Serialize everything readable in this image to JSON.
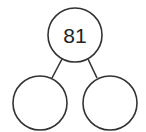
{
  "diagram": {
    "type": "number-bond",
    "whole": {
      "value": "81",
      "cx": 75,
      "cy": 35,
      "r": 27
    },
    "parts": [
      {
        "value": "",
        "cx": 40,
        "cy": 103,
        "r": 27
      },
      {
        "value": "",
        "cx": 110,
        "cy": 103,
        "r": 27
      }
    ],
    "connectors": [
      {
        "x1": 62,
        "y1": 59,
        "x2": 52,
        "y2": 78
      },
      {
        "x1": 88,
        "y1": 59,
        "x2": 97,
        "y2": 78
      }
    ],
    "colors": {
      "stroke": "#333333",
      "text": "#222222",
      "background": "#ffffff"
    }
  }
}
